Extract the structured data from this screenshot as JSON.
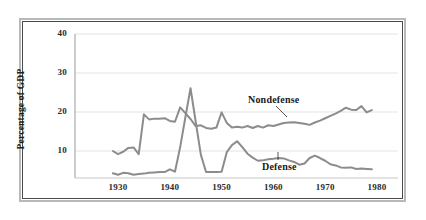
{
  "chart_data": {
    "type": "line",
    "title": "",
    "xlabel": "",
    "ylabel": "Percentage of GDP",
    "xlim": [
      1929,
      1980
    ],
    "ylim": [
      0,
      40
    ],
    "grid": true,
    "legend_position": "inline-annotations",
    "y_ticks": [
      10,
      20,
      30,
      40
    ],
    "y_tick_labels": [
      "10",
      "20",
      "30",
      "40"
    ],
    "x_ticks": [
      1930,
      1940,
      1950,
      1960,
      1970,
      1980
    ],
    "x_tick_labels": [
      "1930",
      "1940",
      "1950",
      "1960",
      "1970",
      "1980"
    ],
    "annotations": [
      {
        "text": "Nondefense",
        "x": 1958,
        "y": 22.5
      },
      {
        "text": "Defense",
        "x": 1960,
        "y": 5.5
      }
    ],
    "series": [
      {
        "name": "Nondefense",
        "color": "#8c8c8c",
        "x": [
          1929,
          1930,
          1931,
          1932,
          1933,
          1934,
          1935,
          1936,
          1937,
          1938,
          1939,
          1940,
          1941,
          1942,
          1943,
          1944,
          1945,
          1946,
          1947,
          1948,
          1949,
          1950,
          1951,
          1952,
          1953,
          1954,
          1955,
          1956,
          1957,
          1958,
          1959,
          1960,
          1961,
          1962,
          1963,
          1964,
          1965,
          1966,
          1967,
          1968,
          1969,
          1970,
          1971,
          1972,
          1973,
          1974,
          1975,
          1976,
          1977,
          1978,
          1979
        ],
        "values": [
          10.0,
          9.2,
          9.8,
          10.8,
          10.9,
          9.2,
          19.4,
          18.1,
          18.3,
          18.3,
          18.4,
          17.7,
          17.5,
          21.2,
          19.7,
          18.2,
          16.4,
          16.6,
          15.9,
          15.7,
          16.0,
          19.9,
          17.2,
          16.0,
          16.2,
          16.0,
          16.4,
          15.9,
          16.4,
          16.0,
          16.6,
          16.4,
          16.8,
          17.2,
          17.3,
          17.4,
          17.2,
          17.0,
          16.7,
          17.3,
          17.8,
          18.4,
          19.0,
          19.6,
          20.3,
          21.1,
          20.6,
          20.5,
          21.5,
          19.9,
          20.5
        ]
      },
      {
        "name": "Defense",
        "color": "#8c8c8c",
        "x": [
          1929,
          1930,
          1931,
          1932,
          1933,
          1934,
          1935,
          1936,
          1937,
          1938,
          1939,
          1940,
          1941,
          1942,
          1943,
          1944,
          1945,
          1946,
          1947,
          1948,
          1949,
          1950,
          1951,
          1952,
          1953,
          1954,
          1955,
          1956,
          1957,
          1958,
          1959,
          1960,
          1961,
          1962,
          1963,
          1964,
          1965,
          1966,
          1967,
          1968,
          1969,
          1970,
          1971,
          1972,
          1973,
          1974,
          1975,
          1976,
          1977,
          1978,
          1979
        ],
        "values": [
          4.3,
          3.9,
          4.4,
          4.3,
          3.9,
          4.1,
          4.2,
          4.4,
          4.5,
          4.6,
          4.6,
          5.3,
          4.7,
          11.0,
          18.6,
          26.1,
          17.5,
          9.0,
          4.6,
          4.6,
          4.6,
          4.7,
          9.7,
          11.5,
          12.5,
          11.0,
          9.3,
          8.3,
          7.5,
          7.6,
          7.9,
          8.0,
          8.2,
          8.1,
          7.6,
          7.2,
          6.5,
          6.8,
          8.2,
          8.8,
          8.2,
          7.5,
          6.6,
          6.3,
          5.8,
          5.7,
          5.8,
          5.4,
          5.5,
          5.4,
          5.3
        ]
      }
    ]
  },
  "figure": {
    "y_axis_title": "Percentage of GDP"
  }
}
